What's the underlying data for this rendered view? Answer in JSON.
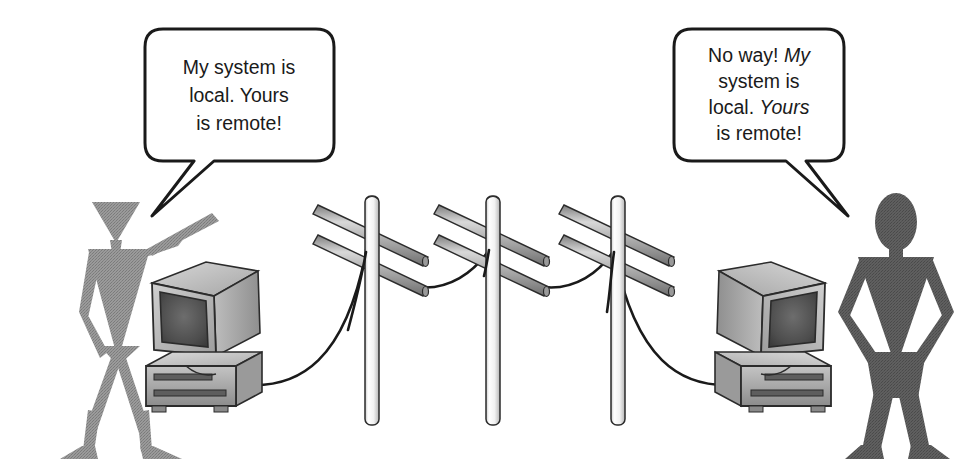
{
  "illustration": {
    "title": "Local versus remote systems cartoon",
    "background_color": "#ffffff",
    "ink_color": "#1a1a1a"
  },
  "speech_bubbles": [
    {
      "id": "left-bubble",
      "speaker": "left-person",
      "lines": [
        {
          "segments": [
            {
              "text": "My system is",
              "italic": false
            }
          ]
        },
        {
          "segments": [
            {
              "text": "local. Yours",
              "italic": false
            }
          ]
        },
        {
          "segments": [
            {
              "text": "is remote!",
              "italic": false
            }
          ]
        }
      ],
      "plain_text": "My system is local. Yours is remote!",
      "tail_direction": "down-left",
      "fill": "#ffffff",
      "stroke": "#1a1a1a"
    },
    {
      "id": "right-bubble",
      "speaker": "right-person",
      "lines": [
        {
          "segments": [
            {
              "text": "No way! ",
              "italic": false
            },
            {
              "text": "My",
              "italic": true
            }
          ]
        },
        {
          "segments": [
            {
              "text": "system is",
              "italic": false
            }
          ]
        },
        {
          "segments": [
            {
              "text": "local. ",
              "italic": false
            },
            {
              "text": "Yours",
              "italic": true
            }
          ]
        },
        {
          "segments": [
            {
              "text": "is remote!",
              "italic": false
            }
          ]
        }
      ],
      "plain_text": "No way! My system is local. Yours is remote!",
      "tail_direction": "down-right",
      "fill": "#ffffff",
      "stroke": "#1a1a1a"
    }
  ],
  "figures": [
    {
      "id": "left-person",
      "pose": "pointing at computer",
      "head_shape": "inverted-triangle",
      "fill": "#8e8e8e"
    },
    {
      "id": "right-person",
      "pose": "hands on hips",
      "head_shape": "oval",
      "fill": "#5c5c5c"
    }
  ],
  "computers": [
    {
      "id": "left-computer",
      "type": "crt-monitor-on-desktop-case",
      "facing": "right",
      "case_fill": "#b8b8b8",
      "screen_fill": "#4a4a4a"
    },
    {
      "id": "right-computer",
      "type": "crt-monitor-on-desktop-case",
      "facing": "left",
      "case_fill": "#b8b8b8",
      "screen_fill": "#4a4a4a"
    }
  ],
  "poles": [
    {
      "id": "pole-1",
      "x": 372,
      "crossarms": 2
    },
    {
      "id": "pole-2",
      "x": 493,
      "crossarms": 2
    },
    {
      "id": "pole-3",
      "x": 618,
      "crossarms": 2
    }
  ],
  "wire": {
    "id": "network-wire",
    "description": "cable running from left computer over three poles to right computer",
    "stroke": "#1a1a1a"
  }
}
